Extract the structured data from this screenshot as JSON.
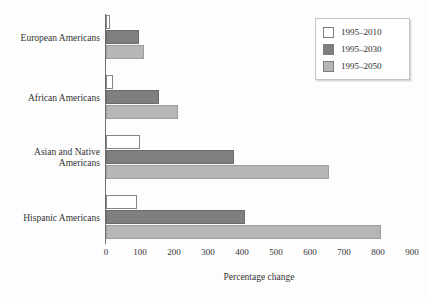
{
  "chart_data": {
    "type": "bar",
    "orientation": "horizontal",
    "title": "",
    "xlabel": "Percentage change",
    "ylabel": "",
    "xlim": [
      0,
      900
    ],
    "xticks": [
      0,
      100,
      200,
      300,
      400,
      500,
      600,
      700,
      800,
      900
    ],
    "xtick_labels": [
      "0",
      "100",
      "200",
      "300",
      "400",
      "500",
      "600",
      "700",
      "800",
      "900"
    ],
    "grid": false,
    "legend_position": "top-right",
    "categories": [
      "European Americans",
      "African Americans",
      "Asian and Native Americans",
      "Hispanic Americans"
    ],
    "category_lines": [
      [
        "European Americans"
      ],
      [
        "African Americans"
      ],
      [
        "Asian and Native",
        "Americans"
      ],
      [
        "Hispanic Americans"
      ]
    ],
    "series": [
      {
        "name": "1995–2010",
        "color": "#ffffff",
        "values": [
          12,
          22,
          100,
          90
        ]
      },
      {
        "name": "1995–2030",
        "color": "#7f7f7f",
        "values": [
          97,
          155,
          375,
          410
        ]
      },
      {
        "name": "1995–2050",
        "color": "#b6b6b6",
        "values": [
          113,
          212,
          655,
          810
        ]
      }
    ]
  },
  "legend": {
    "items": [
      {
        "label": "1995–2010",
        "color": "#ffffff"
      },
      {
        "label": "1995–2030",
        "color": "#7f7f7f"
      },
      {
        "label": "1995–2050",
        "color": "#b6b6b6"
      }
    ]
  },
  "axis": {
    "x_title": "Percentage change"
  }
}
